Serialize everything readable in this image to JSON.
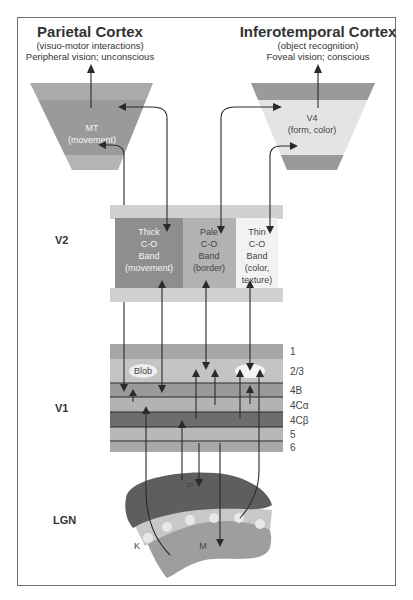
{
  "titles": {
    "parietal": {
      "title": "Parietal Cortex",
      "subtitle1": "(visuo-motor interactions)",
      "subtitle2": "Peripheral vision; unconscious"
    },
    "inferotemporal": {
      "title": "Inferotemporal Cortex",
      "subtitle1": "(object recognition)",
      "subtitle2": "Foveal vision; conscious"
    }
  },
  "areas": {
    "mt": {
      "line1": "MT",
      "line2": "(movement)"
    },
    "v4": {
      "line1": "V4",
      "line2": "(form, color)"
    }
  },
  "side_labels": {
    "v2": "V2",
    "v1": "V1",
    "lgn": "LGN"
  },
  "v2_bands": [
    {
      "name": "thick",
      "lines": [
        "Thick",
        "C-O",
        "Band",
        "(movement)"
      ],
      "color": "#8c8c8c"
    },
    {
      "name": "pale",
      "lines": [
        "Pale",
        "C-O",
        "Band",
        "(border)"
      ],
      "color": "#b4b4b4"
    },
    {
      "name": "thin",
      "lines": [
        "Thin",
        "C-O",
        "Band",
        "(color,",
        "texture)"
      ],
      "color": "#f2f2f2"
    }
  ],
  "v1_layers": [
    {
      "label": "1",
      "color": "#a6a6a6"
    },
    {
      "label": "2/3",
      "color": "#c2c2c2"
    },
    {
      "label": "4B",
      "color": "#9a9a9a"
    },
    {
      "label": "4Cα",
      "color": "#b3b3b3"
    },
    {
      "label": "4Cβ",
      "color": "#6f6f6f"
    },
    {
      "label": "5",
      "color": "#b8b8b8"
    },
    {
      "label": "6",
      "color": "#a9a9a9"
    }
  ],
  "v1_blob_label": "Blob",
  "lgn": {
    "parvo_label": "P",
    "magno_label": "M",
    "konio_label": "K"
  },
  "colors": {
    "frame": "#6e6e6e",
    "dark": "#606060",
    "mid": "#9c9c9c",
    "light": "#c8c8c8",
    "very_light": "#e6e6e6",
    "arrow": "#2a2a2a"
  }
}
